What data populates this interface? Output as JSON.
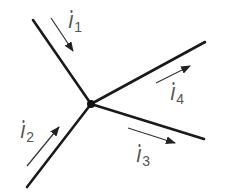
{
  "diagram": {
    "type": "circuit-node-currents",
    "node": {
      "x": 91,
      "y": 104
    },
    "wires": [
      {
        "name": "upper-left",
        "x1": 33,
        "y1": 20,
        "x2": 91,
        "y2": 104
      },
      {
        "name": "lower-left",
        "x1": 27,
        "y1": 187,
        "x2": 91,
        "y2": 104
      },
      {
        "name": "upper-right",
        "x1": 91,
        "y1": 104,
        "x2": 205,
        "y2": 42
      },
      {
        "name": "lower-right",
        "x1": 91,
        "y1": 104,
        "x2": 204,
        "y2": 139
      }
    ],
    "currents": [
      {
        "symbol": "I",
        "subscript": "1",
        "direction": "into-node",
        "arrow": {
          "x1": 51,
          "y1": 18,
          "x2": 73,
          "y2": 51
        }
      },
      {
        "symbol": "I",
        "subscript": "2",
        "direction": "into-node",
        "arrow": {
          "x1": 27,
          "y1": 166,
          "x2": 59,
          "y2": 127
        }
      },
      {
        "symbol": "I",
        "subscript": "3",
        "direction": "out-of-node",
        "arrow": {
          "x1": 128,
          "y1": 128,
          "x2": 175,
          "y2": 143
        }
      },
      {
        "symbol": "I",
        "subscript": "4",
        "direction": "out-of-node",
        "arrow": {
          "x1": 156,
          "y1": 83,
          "x2": 190,
          "y2": 66
        }
      }
    ],
    "colors": {
      "wire": "#1a1a1a",
      "arrow": "#333333",
      "label": "#555555"
    }
  }
}
